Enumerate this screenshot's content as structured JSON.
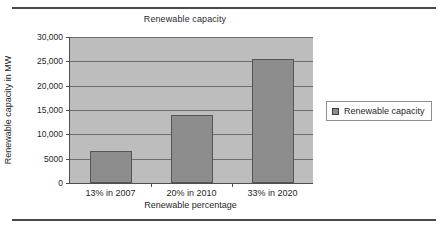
{
  "chart_data": {
    "type": "bar",
    "title": "Renewable capacity",
    "xlabel": "Renewable percentage",
    "ylabel": "Renewable capacity in MW",
    "categories": [
      "13% in 2007",
      "20% in 2010",
      "33% in 2020"
    ],
    "values": [
      6500,
      14000,
      25500
    ],
    "series": [
      {
        "name": "Renewable capacity",
        "values": [
          6500,
          14000,
          25500
        ]
      }
    ],
    "ylim": [
      0,
      30000
    ],
    "ytick_values": [
      0,
      5000,
      10000,
      15000,
      20000,
      25000,
      30000
    ],
    "ytick_labels": [
      "0",
      "5000",
      "10,000",
      "15,000",
      "20,000",
      "25,000",
      "30,000"
    ],
    "grid": true,
    "legend_position": "right",
    "legend_entries": [
      "Renewable capacity"
    ],
    "colors": {
      "bar_fill": "#8d8d8d",
      "bar_border": "#555555",
      "plot_background": "#bdbdbd",
      "gridline": "#6d6d6d",
      "axis": "#4f4f4f",
      "rule": "#4a4a4a",
      "text": "#1f1f1f",
      "figure_background": "#ffffff"
    }
  },
  "legend": {
    "swatch_icon": "legend-swatch-square",
    "label": "Renewable capacity"
  }
}
